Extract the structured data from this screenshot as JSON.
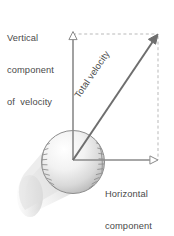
{
  "figure": {
    "background_color": "#ffffff"
  },
  "labels": {
    "vertical": {
      "name": "vertical-component-label",
      "line1": "Vertical",
      "line2": "component",
      "line3": "of  velocity",
      "full_text": "Vertical component of velocity",
      "color": "#4a4a4a"
    },
    "horizontal": {
      "name": "horizontal-component-label",
      "line1": "Horizontal",
      "line2": "component",
      "line3": "of  velocity",
      "full_text": "Horizontal component of velocity",
      "color": "#4a4a4a"
    },
    "total": {
      "name": "total-velocity-label",
      "text": "Total  velocity",
      "rotation_deg": -55.8,
      "color": "#4a4a4a"
    }
  },
  "vectors": {
    "origin": {
      "x": 73,
      "y": 160
    },
    "vertical": {
      "name": "vertical-velocity-arrow",
      "from": {
        "x": 73,
        "y": 160
      },
      "to": {
        "x": 73,
        "y": 34
      },
      "color": "#8a8a8a",
      "arrowhead": "hollow-triangle"
    },
    "horizontal": {
      "name": "horizontal-velocity-arrow",
      "from": {
        "x": 73,
        "y": 160
      },
      "to": {
        "x": 158,
        "y": 160
      },
      "color": "#8a8a8a",
      "arrowhead": "hollow-triangle"
    },
    "total": {
      "name": "total-velocity-arrow",
      "from": {
        "x": 73,
        "y": 160
      },
      "to": {
        "x": 158,
        "y": 34
      },
      "color": "#6e6e6e",
      "arrowhead": "solid-triangle"
    }
  },
  "construction_lines": {
    "top_dashed": {
      "name": "top-dashed-construction-line",
      "from": {
        "x": 73,
        "y": 34
      },
      "to": {
        "x": 158,
        "y": 34
      },
      "color": "#b9b9b9",
      "style": "dashed"
    },
    "right_dashed": {
      "name": "right-dashed-construction-line",
      "from": {
        "x": 158,
        "y": 34
      },
      "to": {
        "x": 158,
        "y": 160
      },
      "color": "#b9b9b9",
      "style": "dashed"
    }
  },
  "baseball": {
    "name": "baseball-illustration",
    "center": {
      "x": 73,
      "y": 162
    },
    "radius": 32,
    "outline_color": "#8d8d8d",
    "seam_color": "#8d8d8d",
    "highlight_color": "#ffffff",
    "body_color": "#e6e6e6"
  },
  "motion_trail": {
    "name": "motion-blur-trail",
    "color": "#d8d8d8",
    "direction": "lower-left"
  }
}
